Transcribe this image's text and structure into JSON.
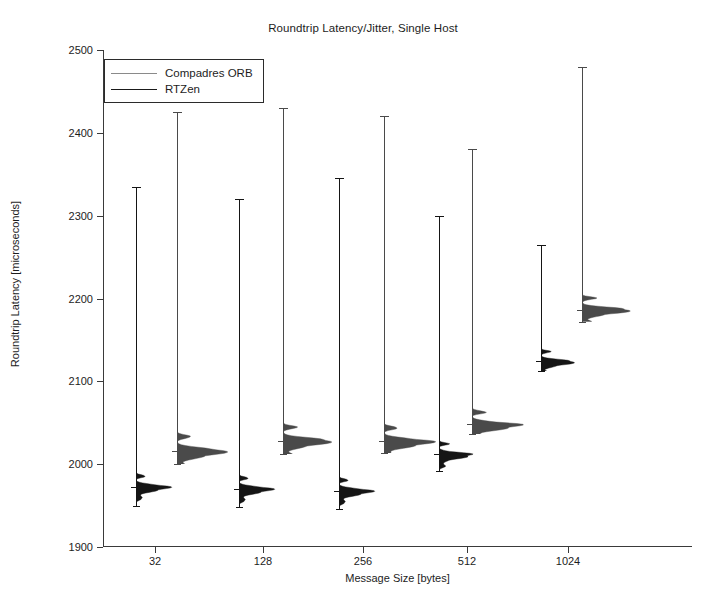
{
  "chart_data": {
    "type": "violin",
    "title": "Roundtrip Latency/Jitter, Single Host",
    "xlabel": "Message Size [bytes]",
    "ylabel": "Roundtrip Latency [microseconds]",
    "ylim": [
      1900,
      2500
    ],
    "yticks": [
      1900,
      2000,
      2100,
      2200,
      2300,
      2400,
      2500
    ],
    "xticks": [
      32,
      128,
      256,
      512,
      1024
    ],
    "xtick_labels": [
      "32",
      "128",
      "256",
      "512",
      "1024"
    ],
    "grid": false,
    "legend_position": "top-left",
    "legend": [
      "Compadres ORB",
      "RTZen"
    ],
    "series": [
      {
        "name": "RTZen",
        "color": "#111111",
        "values": [
          1978,
          1976,
          1974,
          2018,
          2126
        ],
        "whisker_high": [
          2335,
          2320,
          2345,
          2300,
          2265
        ],
        "whisker_low": [
          1950,
          1948,
          1946,
          1992,
          2112
        ],
        "median": [
          1972,
          1970,
          1968,
          2012,
          2124
        ],
        "peak_width": 0.52
      },
      {
        "name": "Compadres ORB",
        "color": "#8a8a8a",
        "values": [
          2020,
          2032,
          2032,
          2052,
          2188
        ],
        "whisker_high": [
          2425,
          2430,
          2420,
          2380,
          2480
        ],
        "whisker_low": [
          2000,
          2012,
          2014,
          2036,
          2172
        ],
        "median": [
          2016,
          2028,
          2028,
          2048,
          2186
        ],
        "peak_width": 0.78
      }
    ],
    "groups": [
      {
        "size": "32",
        "rtzen": {
          "median": 1972,
          "body_low": 1950,
          "body_high": 1996,
          "whisker_high": 2335,
          "peak": 1972
        },
        "compadres": {
          "median": 2016,
          "body_low": 2000,
          "body_high": 2062,
          "whisker_high": 2425,
          "peak": 2018
        }
      },
      {
        "size": "128",
        "rtzen": {
          "median": 1970,
          "body_low": 1948,
          "body_high": 1994,
          "whisker_high": 2320,
          "peak": 1970
        },
        "compadres": {
          "median": 2028,
          "body_low": 2012,
          "body_high": 2070,
          "whisker_high": 2430,
          "peak": 2030
        }
      },
      {
        "size": "256",
        "rtzen": {
          "median": 1968,
          "body_low": 1946,
          "body_high": 1992,
          "whisker_high": 2345,
          "peak": 1968
        },
        "compadres": {
          "median": 2028,
          "body_low": 2014,
          "body_high": 2072,
          "whisker_high": 2420,
          "peak": 2030
        }
      },
      {
        "size": "512",
        "rtzen": {
          "median": 2012,
          "body_low": 1992,
          "body_high": 2038,
          "whisker_high": 2300,
          "peak": 2012
        },
        "compadres": {
          "median": 2048,
          "body_low": 2036,
          "body_high": 2090,
          "whisker_high": 2380,
          "peak": 2050
        }
      },
      {
        "size": "1024",
        "rtzen": {
          "median": 2124,
          "body_low": 2112,
          "body_high": 2155,
          "whisker_high": 2265,
          "peak": 2126
        },
        "compadres": {
          "median": 2186,
          "body_low": 2172,
          "body_high": 2222,
          "whisker_high": 2480,
          "peak": 2188
        }
      }
    ]
  },
  "axis": {
    "ytick_labels": [
      "2500",
      "2400",
      "2300",
      "2200",
      "2100",
      "2000",
      "1900"
    ],
    "xtick_labels": [
      "32",
      "128",
      "256",
      "512",
      "1024"
    ]
  },
  "legend": {
    "items": [
      {
        "label": "Compadres ORB",
        "color": "#8a8a8a"
      },
      {
        "label": "RTZen",
        "color": "#1a1a1a"
      }
    ]
  }
}
